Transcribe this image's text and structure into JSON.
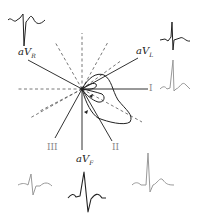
{
  "figure": {
    "leads": [
      {
        "id": "aVR",
        "base": "aV",
        "sub": "R",
        "angle_deg": -150
      },
      {
        "id": "aVL",
        "base": "aV",
        "sub": "L",
        "angle_deg": -30
      },
      {
        "id": "I",
        "label": "I",
        "angle_deg": 0
      },
      {
        "id": "II",
        "label": "II",
        "angle_deg": 60
      },
      {
        "id": "aVF",
        "base": "aV",
        "sub": "F",
        "angle_deg": 90
      },
      {
        "id": "III",
        "label": "III",
        "angle_deg": 120
      }
    ],
    "waveforms": [
      "aVR",
      "aVL",
      "I",
      "II",
      "aVF",
      "III"
    ],
    "colors": {
      "positive_axis": "#333333",
      "negative_axis": "#555555",
      "loop": "#222222",
      "trace_dark": "#222222",
      "trace_light": "#999999"
    }
  }
}
